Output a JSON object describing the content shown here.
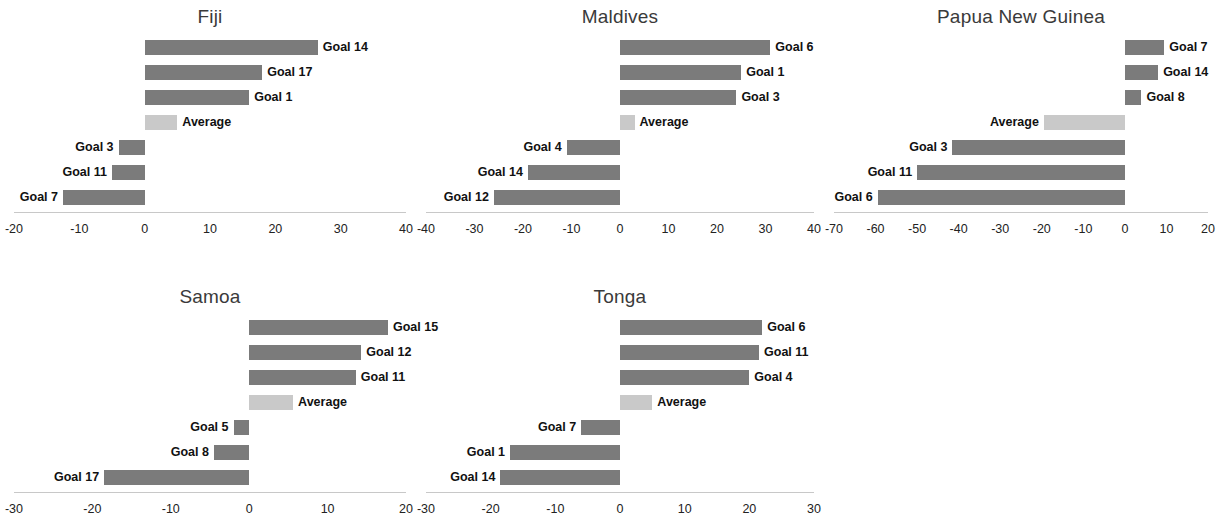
{
  "figure": {
    "background": "#ffffff",
    "bar_color": "#7b7b7b",
    "average_color": "#c9c9c9",
    "axis_color": "#c8c8c8",
    "bar_height_px": 15
  },
  "chart_data": [
    {
      "type": "bar",
      "orientation": "horizontal",
      "title": "Fiji",
      "xlabel": "",
      "ylabel": "",
      "xlim": [
        -20,
        40
      ],
      "xticks": [
        -20,
        -10,
        0,
        10,
        20,
        30,
        40
      ],
      "xtick_labels": [
        "-20",
        "-10",
        "0",
        "10",
        "20",
        "30",
        "40"
      ],
      "grid": false,
      "legend": "none",
      "categories": [
        "Goal 14",
        "Goal 17",
        "Goal 1",
        "Average",
        "Goal 3",
        "Goal 11",
        "Goal 7"
      ],
      "values": [
        26.5,
        18,
        16,
        5,
        -4,
        -5,
        -12.5
      ],
      "highlight_category": "Average"
    },
    {
      "type": "bar",
      "orientation": "horizontal",
      "title": "Maldives",
      "xlabel": "",
      "ylabel": "",
      "xlim": [
        -40,
        40
      ],
      "xticks": [
        -40,
        -30,
        -20,
        -10,
        0,
        10,
        20,
        30,
        40
      ],
      "xtick_labels": [
        "-40",
        "-30",
        "-20",
        "-10",
        "0",
        "10",
        "20",
        "30",
        "40"
      ],
      "grid": false,
      "legend": "none",
      "categories": [
        "Goal 6",
        "Goal 1",
        "Goal 3",
        "Average",
        "Goal 4",
        "Goal 14",
        "Goal 12"
      ],
      "values": [
        31,
        25,
        24,
        3,
        -11,
        -19,
        -26
      ],
      "highlight_category": "Average"
    },
    {
      "type": "bar",
      "orientation": "horizontal",
      "title": "Papua New Guinea",
      "xlabel": "",
      "ylabel": "",
      "xlim": [
        -70,
        20
      ],
      "xticks": [
        -70,
        -60,
        -50,
        -40,
        -30,
        -20,
        -10,
        0,
        10,
        20
      ],
      "xtick_labels": [
        "-70",
        "-60",
        "-50",
        "-40",
        "-30",
        "-20",
        "-10",
        "0",
        "10",
        "20"
      ],
      "grid": false,
      "legend": "none",
      "categories": [
        "Goal 7",
        "Goal 14",
        "Goal 8",
        "Average",
        "Goal 3",
        "Goal 11",
        "Goal 6"
      ],
      "values": [
        9.5,
        8,
        4,
        -19.5,
        -41.5,
        -50,
        -59.5
      ],
      "highlight_category": "Average"
    },
    {
      "type": "bar",
      "orientation": "horizontal",
      "title": "Samoa",
      "xlabel": "",
      "ylabel": "",
      "xlim": [
        -30,
        20
      ],
      "xticks": [
        -30,
        -20,
        -10,
        0,
        10,
        20
      ],
      "xtick_labels": [
        "-30",
        "-20",
        "-10",
        "0",
        "10",
        "20"
      ],
      "grid": false,
      "legend": "none",
      "categories": [
        "Goal 15",
        "Goal 12",
        "Goal 11",
        "Average",
        "Goal 5",
        "Goal 8",
        "Goal 17"
      ],
      "values": [
        17.7,
        14.3,
        13.6,
        5.6,
        -2,
        -4.5,
        -18.5
      ],
      "highlight_category": "Average"
    },
    {
      "type": "bar",
      "orientation": "horizontal",
      "title": "Tonga",
      "xlabel": "",
      "ylabel": "",
      "xlim": [
        -30,
        30
      ],
      "xticks": [
        -30,
        -20,
        -10,
        0,
        10,
        20,
        30
      ],
      "xtick_labels": [
        "-30",
        "-20",
        "-10",
        "0",
        "10",
        "20",
        "30"
      ],
      "grid": false,
      "legend": "none",
      "categories": [
        "Goal 6",
        "Goal 11",
        "Goal 4",
        "Average",
        "Goal 7",
        "Goal 1",
        "Goal 14"
      ],
      "values": [
        22,
        21.5,
        20,
        5,
        -6,
        -17,
        -18.5
      ],
      "highlight_category": "Average"
    }
  ],
  "panels_layout": [
    {
      "left": 8,
      "top": 4,
      "width": 404,
      "plot_width": 392,
      "zero_frac": 0.333
    },
    {
      "left": 420,
      "top": 4,
      "width": 400,
      "plot_width": 388,
      "zero_frac": 0.5
    },
    {
      "left": 828,
      "top": 4,
      "width": 386,
      "plot_width": 374,
      "zero_frac": 0.778
    },
    {
      "left": 8,
      "top": 284,
      "width": 404,
      "plot_width": 392,
      "zero_frac": 0.6
    },
    {
      "left": 420,
      "top": 284,
      "width": 400,
      "plot_width": 388,
      "zero_frac": 0.5
    }
  ]
}
